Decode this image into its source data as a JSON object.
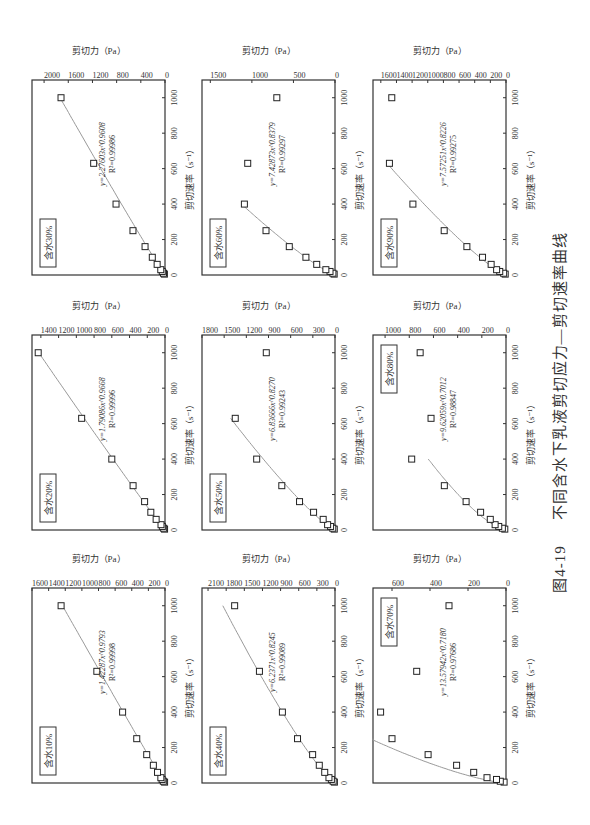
{
  "figure": {
    "number": "图4-19",
    "caption": "不同含水下乳液剪切应力—剪切速率曲线"
  },
  "axes_common": {
    "xlabel": "剪切速率（s⁻¹）",
    "ylabel": "剪切力（Pa）",
    "xticks": [
      0,
      200,
      400,
      600,
      800,
      1000
    ]
  },
  "chart_data": [
    {
      "type": "scatter",
      "title": "含水10%",
      "xlabel": "剪切速率（s⁻¹）",
      "ylabel": "剪切力（Pa）",
      "xlim": [
        0,
        1100
      ],
      "ylim": [
        0,
        1600
      ],
      "yticks": [
        0,
        200,
        400,
        600,
        800,
        1000,
        1200,
        1400,
        1600
      ],
      "x": [
        5,
        10,
        20,
        30,
        60,
        100,
        160,
        250,
        400,
        630,
        1000
      ],
      "y": [
        5,
        20,
        35,
        50,
        90,
        140,
        220,
        340,
        510,
        820,
        1250
      ],
      "fit": {
        "equation": "y=1.42287x^0.9793",
        "r2": "R²=0.99998",
        "a": 1.42287,
        "b": 0.9793,
        "xmax": 1000
      },
      "legend_position": "upper-left"
    },
    {
      "type": "scatter",
      "title": "含水20%",
      "xlabel": "剪切速率（s⁻¹）",
      "ylabel": "剪切力（Pa）",
      "xlim": [
        0,
        1100
      ],
      "ylim": [
        0,
        1500
      ],
      "yticks": [
        0,
        200,
        400,
        600,
        800,
        1000,
        1200,
        1400
      ],
      "x": [
        5,
        10,
        20,
        30,
        60,
        100,
        160,
        250,
        400,
        630,
        1000
      ],
      "y": [
        5,
        15,
        30,
        45,
        100,
        160,
        230,
        360,
        600,
        940,
        1430
      ],
      "fit": {
        "equation": "y=1.79086x^0.9668",
        "r2": "R²=0.99996",
        "a": 1.79086,
        "b": 0.9668,
        "xmax": 1000
      },
      "legend_position": "upper-left"
    },
    {
      "type": "scatter",
      "title": "含水30%",
      "xlabel": "剪切速率（s⁻¹）",
      "ylabel": "剪切力（Pa）",
      "xlim": [
        0,
        1100
      ],
      "ylim": [
        0,
        2200
      ],
      "yticks": [
        0,
        400,
        800,
        1200,
        1600,
        2000
      ],
      "x": [
        5,
        10,
        20,
        30,
        60,
        100,
        160,
        250,
        400,
        630,
        1000
      ],
      "y": [
        10,
        25,
        45,
        70,
        130,
        210,
        330,
        530,
        810,
        1180,
        1720
      ],
      "fit": {
        "equation": "y=2.27603x^0.9608",
        "r2": "R²=0.99986",
        "a": 2.27603,
        "b": 0.9608,
        "xmax": 1000
      },
      "legend_position": "upper-left"
    },
    {
      "type": "scatter",
      "title": "含水40%",
      "xlabel": "剪切速率（s⁻¹）",
      "ylabel": "剪切力（Pa）",
      "xlim": [
        0,
        1100
      ],
      "ylim": [
        0,
        2200
      ],
      "yticks": [
        0,
        300,
        600,
        900,
        1200,
        1500,
        1800,
        2100
      ],
      "x": [
        5,
        10,
        20,
        30,
        60,
        100,
        160,
        250,
        400,
        630,
        1000
      ],
      "y": [
        10,
        30,
        60,
        100,
        170,
        260,
        370,
        620,
        870,
        1250,
        1660
      ],
      "fit": {
        "equation": "y=6.2371x^0.8245",
        "r2": "R²=0.99089",
        "a": 6.2371,
        "b": 0.8245,
        "xmax": 1000
      },
      "legend_position": "upper-left"
    },
    {
      "type": "scatter",
      "title": "含水50%",
      "xlabel": "剪切速率（s⁻¹）",
      "ylabel": "剪切力（Pa）",
      "xlim": [
        0,
        1100
      ],
      "ylim": [
        0,
        1800
      ],
      "yticks": [
        0,
        300,
        600,
        900,
        1200,
        1500,
        1800
      ],
      "x": [
        5,
        10,
        20,
        30,
        60,
        100,
        160,
        250,
        400,
        630,
        1000
      ],
      "y": [
        10,
        30,
        60,
        100,
        160,
        290,
        480,
        720,
        1060,
        1350,
        930
      ],
      "fit": {
        "equation": "y=6.83666x^0.8270",
        "r2": "R²=0.99243",
        "a": 6.83666,
        "b": 0.827,
        "xmax": 630
      },
      "legend_position": "upper-left"
    },
    {
      "type": "scatter",
      "title": "含水60%",
      "xlabel": "剪切速率（s⁻¹）",
      "ylabel": "剪切力（Pa）",
      "xlim": [
        0,
        1100
      ],
      "ylim": [
        0,
        1600
      ],
      "yticks": [
        0,
        500,
        1000,
        1500
      ],
      "x": [
        5,
        10,
        20,
        30,
        60,
        100,
        160,
        250,
        400,
        630,
        1000
      ],
      "y": [
        10,
        25,
        60,
        110,
        220,
        350,
        550,
        830,
        1090,
        1050,
        700
      ],
      "fit": {
        "equation": "y=7.42873x^0.8379",
        "r2": "R²=0.99297",
        "a": 7.42873,
        "b": 0.8379,
        "xmax": 400
      },
      "legend_position": "upper-left"
    },
    {
      "type": "scatter",
      "title": "含水70%",
      "xlabel": "剪切速率（s⁻¹）",
      "ylabel": "剪切力（Pa）",
      "xlim": [
        0,
        1100
      ],
      "ylim": [
        0,
        700
      ],
      "yticks": [
        0,
        200,
        400,
        600
      ],
      "x": [
        5,
        10,
        20,
        30,
        60,
        100,
        160,
        250,
        400,
        630,
        1000
      ],
      "y": [
        10,
        30,
        50,
        100,
        170,
        260,
        410,
        600,
        660,
        470,
        300
      ],
      "fit": {
        "equation": "y=13.57942x^0.7180",
        "r2": "R²=0.97686",
        "a": 13.57942,
        "b": 0.718,
        "xmax": 250
      },
      "legend_position": "upper-right"
    },
    {
      "type": "scatter",
      "title": "含水80%",
      "xlabel": "剪切速率（s⁻¹）",
      "ylabel": "剪切力（Pa）",
      "xlim": [
        0,
        1100
      ],
      "ylim": [
        0,
        1100
      ],
      "yticks": [
        0,
        200,
        400,
        600,
        800,
        1000
      ],
      "x": [
        5,
        10,
        20,
        30,
        60,
        100,
        160,
        250,
        400,
        630,
        1000
      ],
      "y": [
        10,
        30,
        60,
        90,
        130,
        210,
        330,
        510,
        780,
        620,
        710
      ],
      "fit": {
        "equation": "y=9.62059x^0.7012",
        "r2": "R²=0.98847",
        "a": 9.62059,
        "b": 0.7012,
        "xmax": 400
      },
      "legend_position": "upper-right"
    },
    {
      "type": "scatter",
      "title": "含水90%",
      "xlabel": "剪切速率（s⁻¹）",
      "ylabel": "剪切力（Pa）",
      "xlim": [
        0,
        1100
      ],
      "ylim": [
        0,
        1700
      ],
      "yticks": [
        0,
        200,
        400,
        600,
        800,
        1000,
        1200,
        1400,
        1600
      ],
      "x": [
        5,
        10,
        20,
        30,
        60,
        100,
        160,
        250,
        400,
        630,
        1000
      ],
      "y": [
        10,
        30,
        80,
        120,
        190,
        300,
        500,
        790,
        1190,
        1490,
        1460
      ],
      "fit": {
        "equation": "y=7.57251x^0.8226",
        "r2": "R²=0.99275",
        "a": 7.57251,
        "b": 0.8226,
        "xmax": 630
      },
      "legend_position": "upper-left"
    }
  ]
}
